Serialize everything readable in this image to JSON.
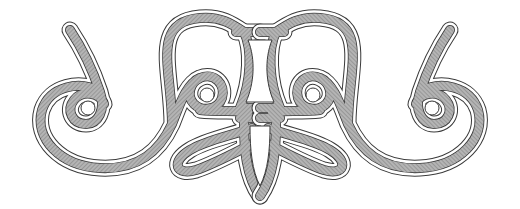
{
  "figure": {
    "type": "decorative-ornament",
    "description": "Symmetrical scroll ornament with hatched double-outlined bands",
    "width": 520,
    "height": 209,
    "symmetry_axis_x": 260
  },
  "colors": {
    "background": "#ffffff",
    "outline": "#3a3a3a",
    "band_fill": "#9a9a9a",
    "band_hatch": "#c8c8c8",
    "gap": "#ffffff"
  },
  "elements": [
    {
      "name": "left-scroll",
      "label": "Left S-scroll with spiral eye"
    },
    {
      "name": "right-scroll",
      "label": "Right S-scroll with spiral eye"
    },
    {
      "name": "center-pillar",
      "label": "Central waisted pillar"
    },
    {
      "name": "center-shield",
      "label": "Lower central shield"
    },
    {
      "name": "left-teardrop-loop",
      "label": "Lower left teardrop loop"
    },
    {
      "name": "right-teardrop-loop",
      "label": "Lower right teardrop loop"
    }
  ]
}
